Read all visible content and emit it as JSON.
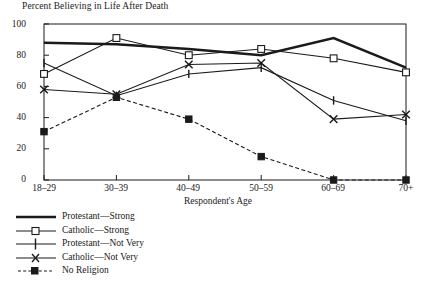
{
  "chart_data": {
    "type": "line",
    "title": "Percent Believing in Life After Death",
    "xlabel": "Respondent's Age",
    "ylabel": "",
    "categories": [
      "18–29",
      "30–39",
      "40–49",
      "50–59",
      "60–69",
      "70+"
    ],
    "ylim": [
      0,
      100
    ],
    "yticks": [
      0,
      20,
      40,
      60,
      80,
      100
    ],
    "ytick_labels": [
      "0",
      "20",
      "40",
      "60",
      "80",
      "100"
    ],
    "grid": false,
    "legend_position": "below-left",
    "series": [
      {
        "name": "Protestant—Strong",
        "marker": "none",
        "line": "solid",
        "values": [
          88,
          87,
          84,
          80,
          91,
          72
        ]
      },
      {
        "name": "Catholic—Strong",
        "marker": "open-square",
        "line": "solid",
        "values": [
          68,
          91,
          80,
          84,
          78,
          69
        ]
      },
      {
        "name": "Protestant—Not Very",
        "marker": "plus",
        "line": "solid",
        "values": [
          75,
          54,
          68,
          72,
          51,
          38
        ]
      },
      {
        "name": "Catholic—Not Very",
        "marker": "cross",
        "line": "solid",
        "values": [
          58,
          55,
          74,
          75,
          39,
          42
        ]
      },
      {
        "name": "No Religion",
        "marker": "filled-square",
        "line": "dashed",
        "values": [
          31,
          53,
          39,
          15,
          0,
          0
        ]
      }
    ]
  },
  "axis": {
    "x_title": "Respondent's Age"
  }
}
